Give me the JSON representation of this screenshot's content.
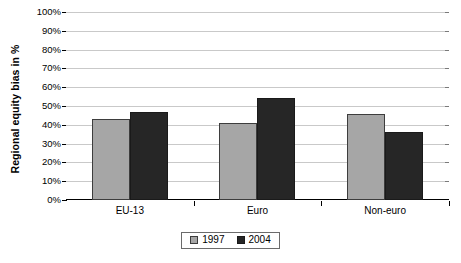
{
  "chart_data": {
    "type": "bar",
    "title": "",
    "xlabel": "",
    "ylabel": "Regional equity bias in %",
    "ylim": [
      0,
      100
    ],
    "ytick_labels": [
      "0%",
      "10%",
      "20%",
      "30%",
      "40%",
      "50%",
      "60%",
      "70%",
      "80%",
      "90%",
      "100%"
    ],
    "ytick_values": [
      0,
      10,
      20,
      30,
      40,
      50,
      60,
      70,
      80,
      90,
      100
    ],
    "categories": [
      "EU-13",
      "Euro",
      "Non-euro"
    ],
    "series": [
      {
        "name": "1997",
        "values": [
          43,
          41,
          46
        ],
        "color": "#a6a6a6"
      },
      {
        "name": "2004",
        "values": [
          47,
          54,
          36
        ],
        "color": "#262626"
      }
    ],
    "grid": "horizontal",
    "legend_position": "bottom"
  },
  "legend": {
    "items": [
      {
        "label": "1997"
      },
      {
        "label": "2004"
      }
    ]
  }
}
